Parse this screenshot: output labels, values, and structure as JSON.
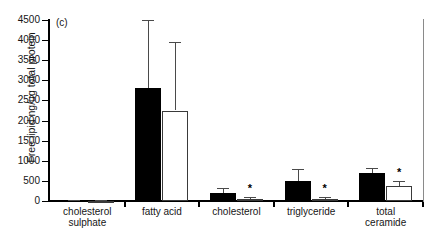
{
  "chart_data": {
    "type": "bar",
    "title": "",
    "panel_label": "(c)",
    "xlabel": "",
    "ylabel": "Free lipid ng/ug total protein",
    "ylim": [
      0,
      4500
    ],
    "yticks": [
      0,
      500,
      1000,
      1500,
      2000,
      2500,
      3000,
      3500,
      4000,
      4500
    ],
    "ytick_labels": [
      "0",
      "500",
      "1000",
      "1500",
      "2000",
      "2500",
      "3000",
      "3500",
      "4000",
      "4500"
    ],
    "grid": false,
    "legend": "none",
    "categories": [
      "cholesterol sulphate",
      "fatty acid",
      "cholesterol",
      "triglyceride",
      "total ceramide"
    ],
    "category_lines": [
      [
        "cholesterol",
        "sulphate"
      ],
      [
        "fatty acid",
        ""
      ],
      [
        "cholesterol",
        ""
      ],
      [
        "triglyceride",
        ""
      ],
      [
        "total",
        "ceramide"
      ]
    ],
    "series": [
      {
        "name": "filled",
        "style": "black-filled",
        "values": [
          15,
          2800,
          200,
          500,
          700
        ],
        "errors": [
          10,
          1700,
          120,
          300,
          130
        ]
      },
      {
        "name": "open",
        "style": "white-open",
        "values": [
          10,
          2250,
          60,
          60,
          380
        ],
        "errors": [
          8,
          1700,
          40,
          35,
          120
        ]
      }
    ],
    "annotations": [
      {
        "text": "*",
        "category": "cholesterol",
        "series": "open"
      },
      {
        "text": "*",
        "category": "triglyceride",
        "series": "open"
      },
      {
        "text": "*",
        "category": "total ceramide",
        "series": "open"
      }
    ]
  }
}
